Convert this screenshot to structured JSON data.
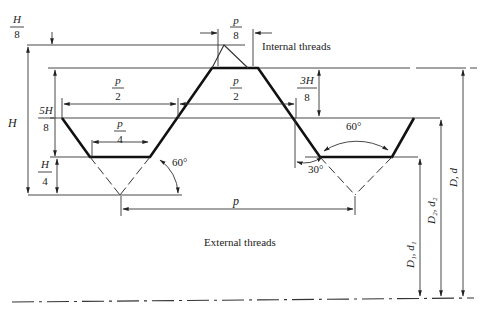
{
  "diagram": {
    "labels": {
      "internal_threads": "Internal threads",
      "external_threads": "External threads"
    },
    "dimensions": {
      "h_over_8": {
        "num": "H",
        "den": "8"
      },
      "p_over_8": {
        "num": "p",
        "den": "8"
      },
      "h": "H",
      "five_h_over_8": {
        "num": "5H",
        "den": "8"
      },
      "h_over_4": {
        "num": "H",
        "den": "4"
      },
      "p_over_2_left": {
        "num": "p",
        "den": "2"
      },
      "p_over_2_right": {
        "num": "p",
        "den": "2"
      },
      "p_over_4": {
        "num": "p",
        "den": "4"
      },
      "three_h_over_8": {
        "num": "3H",
        "den": "8"
      },
      "p": "p",
      "angle_60_left": "60°",
      "angle_60_right": "60°",
      "angle_30": "30°",
      "d_major": "D, d",
      "d_pitch": "D₂, d₂",
      "d_minor": "D₁, d₁"
    }
  }
}
